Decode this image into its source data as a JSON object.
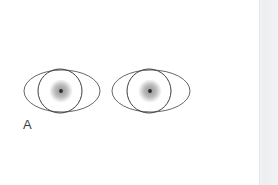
{
  "figure": {
    "panel_label": "A",
    "caption_visible": "",
    "background_color": "#ffffff",
    "scan_edge_color": "#eceef0",
    "stroke_color": "#4a4a4c",
    "iris_outer_color": "#e9e9e9",
    "iris_mid_color": "#b9b9b9",
    "iris_inner_color": "#9a9a9a",
    "pupil_color": "#2b2b2b"
  },
  "eyes": [
    {
      "name": "left-eye",
      "ellipse": {
        "cx": 62,
        "cy": 91,
        "rx": 38,
        "ry": 21
      },
      "cornea_circle": {
        "cx": 60,
        "cy": 91,
        "r": 22
      },
      "iris": {
        "cx": 61,
        "cy": 91,
        "r": 11.5
      },
      "pupil": {
        "cx": 61,
        "cy": 91,
        "r": 1.9
      }
    },
    {
      "name": "right-eye",
      "ellipse": {
        "cx": 151,
        "cy": 91,
        "rx": 39,
        "ry": 21
      },
      "cornea_circle": {
        "cx": 149,
        "cy": 91,
        "r": 22
      },
      "iris": {
        "cx": 150,
        "cy": 91,
        "r": 11.5
      },
      "pupil": {
        "cx": 150,
        "cy": 91,
        "r": 1.9
      }
    }
  ]
}
